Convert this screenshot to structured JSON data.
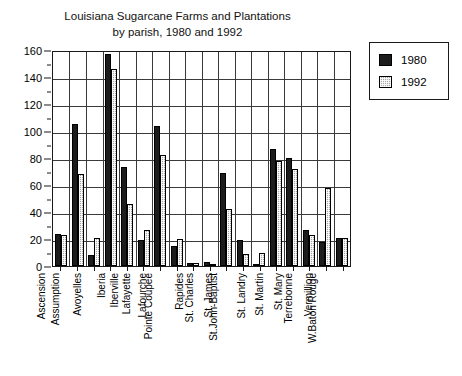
{
  "chart_data": {
    "type": "bar",
    "title": "Louisiana Sugarcane Farms and Plantations",
    "subtitle": "by  parish, 1980 and 1992",
    "xlabel": "",
    "ylabel": "",
    "ylim": [
      0,
      160
    ],
    "ytick_step": 20,
    "yticks": [
      0,
      20,
      40,
      60,
      80,
      100,
      120,
      140,
      160
    ],
    "grid": true,
    "legend_position": "right",
    "categories": [
      "Ascension",
      "Assumption",
      "Avoyelles",
      "Iberia",
      "Iberville",
      "Lafayette",
      "Lafourche",
      "Pointe Coupee",
      "Rapides",
      "St. Charles",
      "St. James",
      "St.John-Baptist",
      "St. Landry",
      "St. Martin",
      "St. Mary",
      "Terrebonne",
      "Vermillion",
      "W.Baton Rouge"
    ],
    "series": [
      {
        "name": "1980",
        "color": "#1c1c1c",
        "values": [
          24,
          105,
          8,
          157,
          73,
          19,
          104,
          15,
          2,
          3,
          69,
          19,
          1,
          87,
          80,
          27,
          18,
          21
        ]
      },
      {
        "name": "1992",
        "color": "#a8a8a8",
        "values": [
          23,
          68,
          21,
          146,
          46,
          27,
          82,
          20,
          2,
          1,
          42,
          9,
          10,
          78,
          72,
          23,
          58,
          21
        ]
      }
    ]
  },
  "legend": {
    "entries": [
      {
        "label": "1980"
      },
      {
        "label": "1992"
      }
    ]
  }
}
